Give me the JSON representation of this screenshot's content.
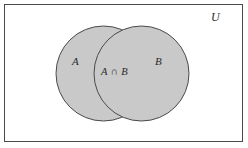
{
  "figure": {
    "kind": "venn-diagram",
    "background_color": "#ffffff"
  },
  "frame": {
    "name": "universal-set-rectangle",
    "border_color": "#4a4a4a",
    "fill_color": "#ffffff",
    "x": 4,
    "y": 4,
    "width": 239,
    "height": 138
  },
  "circles": [
    {
      "set": "A",
      "cx": 103.5,
      "cy": 73.5,
      "r": 47.5,
      "fill_color": "#c9c9c9",
      "stroke_color": "#4a4a4a"
    },
    {
      "set": "B",
      "cx": 141.5,
      "cy": 73.5,
      "r": 47.5,
      "fill_color": "#c9c9c9",
      "stroke_color": "#4a4a4a"
    }
  ],
  "labels": {
    "universe": "U",
    "set_a": "A",
    "set_b": "B",
    "intersection": "A ∩ B"
  },
  "colors": {
    "fill": "#c9c9c9",
    "stroke": "#4a4a4a",
    "text": "#2b2b2b",
    "background": "#ffffff"
  }
}
